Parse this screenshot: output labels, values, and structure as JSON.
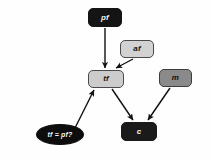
{
  "diagram": {
    "background_color": "#fefefe",
    "edge_color": "#111111",
    "nodes": [
      {
        "id": "pf",
        "label": "pf",
        "shape": "rounded-rect",
        "fill": "#141414",
        "text_color": "#f2f2f2",
        "border": "#141414",
        "x": 88,
        "y": 8,
        "w": 34,
        "h": 19,
        "font_size": 8
      },
      {
        "id": "af",
        "label": "af",
        "shape": "rounded-rect",
        "fill": "#d2d2d2",
        "text_color": "#101010",
        "border": "#4a4a4a",
        "x": 120,
        "y": 40,
        "w": 34,
        "h": 18,
        "font_size": 8
      },
      {
        "id": "tf",
        "label": "tf",
        "shape": "rounded-rect",
        "fill": "#cccccc",
        "text_color": "#101010",
        "border": "#4a4a4a",
        "x": 88,
        "y": 70,
        "w": 36,
        "h": 18,
        "font_size": 8
      },
      {
        "id": "m",
        "label": "m",
        "shape": "rounded-rect",
        "fill": "#8a8a8a",
        "text_color": "#101010",
        "border": "#3d3d3d",
        "x": 159,
        "y": 69,
        "w": 33,
        "h": 18,
        "font_size": 8
      },
      {
        "id": "c",
        "label": "c",
        "shape": "rounded-rect",
        "fill": "#1a1a1a",
        "text_color": "#f2f2f2",
        "border": "#1a1a1a",
        "x": 121,
        "y": 122,
        "w": 36,
        "h": 19,
        "font_size": 8
      },
      {
        "id": "tf-eq-pf",
        "label": "tf = pf?",
        "shape": "ellipse",
        "fill": "#0d0d0d",
        "text_color": "#f4f4f4",
        "border": "#0d0d0d",
        "x": 36,
        "y": 124,
        "w": 48,
        "h": 21,
        "font_size": 7
      }
    ],
    "edges": [
      {
        "id": "pf-to-tf",
        "from": "pf",
        "to": "tf",
        "x1": 105,
        "y1": 28,
        "x2": 105,
        "y2": 68,
        "arrow": true
      },
      {
        "id": "af-to-tf",
        "from": "af",
        "to": "tf",
        "x1": 133,
        "y1": 59,
        "x2": 116,
        "y2": 68,
        "arrow": true
      },
      {
        "id": "tf-to-c",
        "from": "tf",
        "to": "c",
        "x1": 112,
        "y1": 89,
        "x2": 133,
        "y2": 120,
        "arrow": true
      },
      {
        "id": "m-to-c",
        "from": "m",
        "to": "c",
        "x1": 170,
        "y1": 88,
        "x2": 148,
        "y2": 120,
        "arrow": true
      },
      {
        "id": "tfeqpf-to-tf",
        "from": "tf-eq-pf",
        "to": "tf",
        "x1": 75,
        "y1": 128,
        "x2": 94,
        "y2": 90,
        "arrow": true
      }
    ]
  }
}
